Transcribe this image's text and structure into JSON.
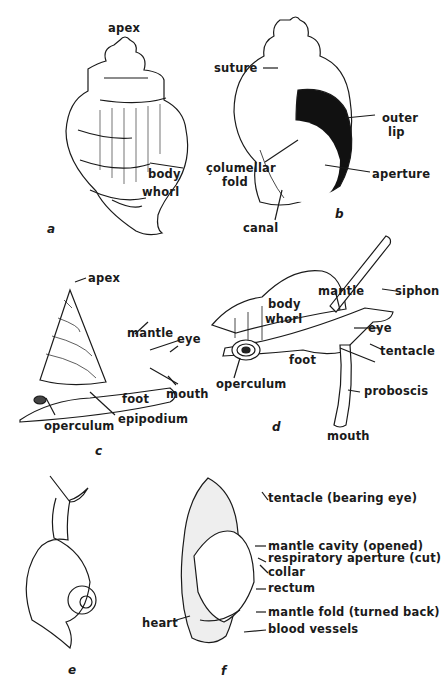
{
  "figures": [
    {
      "id": "a",
      "letter": "a",
      "labels": {
        "apex": "apex",
        "body": "body",
        "whorl": "whorl"
      }
    },
    {
      "id": "b",
      "letter": "b",
      "labels": {
        "suture": "suture",
        "outer": "outer",
        "lip": "lip",
        "columellar": "çolumellar",
        "fold": "fold",
        "aperture": "aperture",
        "canal": "canal"
      }
    },
    {
      "id": "c",
      "letter": "c",
      "labels": {
        "apex": "apex",
        "mantle": "mantle",
        "eye": "eye",
        "mouth": "mouth",
        "foot": "foot",
        "epipodium": "epipodium",
        "operculum": "operculum"
      }
    },
    {
      "id": "d",
      "letter": "d",
      "labels": {
        "body": "body",
        "whorl": "whorl",
        "mantle": "mantle",
        "siphon": "siphon",
        "eye": "eye",
        "tentacle": "tentacle",
        "foot": "foot",
        "operculum": "operculum",
        "proboscis": "proboscis",
        "mouth": "mouth"
      }
    },
    {
      "id": "e",
      "letter": "e",
      "labels": {}
    },
    {
      "id": "f",
      "letter": "f",
      "labels": {
        "tentacle": "tentacle (bearing eye)",
        "mantle_cavity": "mantle cavity (opened)",
        "resp": "respiratory aperture (cut)",
        "collar": "collar",
        "rectum": "rectum",
        "mantle_fold": "mantle fold (turned back)",
        "blood": "blood vessels",
        "heart": "heart"
      }
    }
  ]
}
